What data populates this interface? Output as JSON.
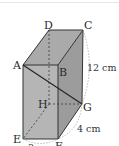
{
  "figure": {
    "type": "rectangular-prism",
    "vertices": {
      "A": "A",
      "B": "B",
      "C": "C",
      "D": "D",
      "E": "E",
      "F": "F",
      "G": "G",
      "H": "H"
    },
    "dimensions": {
      "height": "12 cm",
      "depth": "4 cm",
      "width": "3 cm"
    },
    "colors": {
      "front_face": "#b3b3b3",
      "top_face": "#a8a8a8",
      "side_face": "#9c9c9c",
      "edge": "#3a3a3a",
      "dimension_arc": "#999999"
    }
  }
}
